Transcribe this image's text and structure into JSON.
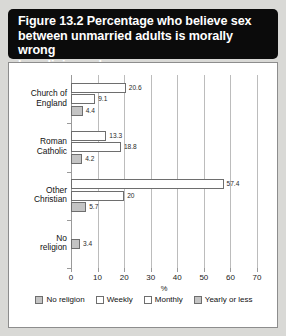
{
  "figure": {
    "title": "Figure 13.2 Percentage who believe sex\nbetween unmarried adults is morally wrong\nby religious observance"
  },
  "chart_data": {
    "type": "bar",
    "orientation": "horizontal",
    "title": "Figure 13.2 Percentage who believe sex between unmarried adults is morally wrong by religious observance",
    "xlabel": "%",
    "ylabel": "",
    "xlim": [
      0,
      70
    ],
    "xticks": [
      0,
      10,
      20,
      30,
      40,
      50,
      60,
      70
    ],
    "grid": true,
    "legend_position": "bottom",
    "categories": [
      "Church of\nEngland",
      "Roman\nCatholic",
      "Other\nChristian",
      "No\nreligion"
    ],
    "series": [
      {
        "name": "Weekly",
        "color": "#ffffff",
        "values": [
          20.6,
          13.3,
          57.4,
          null
        ]
      },
      {
        "name": "Monthly",
        "color": "#ffffff",
        "values": [
          9.1,
          18.8,
          20,
          null
        ]
      },
      {
        "name": "Yearly or less",
        "color": "#c4c4c4",
        "values": [
          4.4,
          4.2,
          5.7,
          null
        ]
      },
      {
        "name": "No religion",
        "color": "#c4c4c4",
        "values": [
          null,
          null,
          null,
          3.4
        ]
      }
    ],
    "legend": [
      {
        "label": "No religion",
        "swatch": "grey"
      },
      {
        "label": "Weekly",
        "swatch": "white"
      },
      {
        "label": "Monthly",
        "swatch": "white"
      },
      {
        "label": "Yearly or less",
        "swatch": "grey"
      }
    ],
    "bars": [
      {
        "category": "Church of England",
        "series": "Weekly",
        "value": 20.6,
        "label": "20.6",
        "swatch": "white"
      },
      {
        "category": "Church of England",
        "series": "Monthly",
        "value": 9.1,
        "label": "9.1",
        "swatch": "white"
      },
      {
        "category": "Church of England",
        "series": "Yearly or less",
        "value": 4.4,
        "label": "4.4",
        "swatch": "grey"
      },
      {
        "category": "Roman Catholic",
        "series": "Weekly",
        "value": 13.3,
        "label": "13.3",
        "swatch": "white"
      },
      {
        "category": "Roman Catholic",
        "series": "Monthly",
        "value": 18.8,
        "label": "18.8",
        "swatch": "white"
      },
      {
        "category": "Roman Catholic",
        "series": "Yearly or less",
        "value": 4.2,
        "label": "4.2",
        "swatch": "grey"
      },
      {
        "category": "Other Christian",
        "series": "Weekly",
        "value": 57.4,
        "label": "57.4",
        "swatch": "white"
      },
      {
        "category": "Other Christian",
        "series": "Monthly",
        "value": 20,
        "label": "20",
        "swatch": "white"
      },
      {
        "category": "Other Christian",
        "series": "Yearly or less",
        "value": 5.7,
        "label": "5.7",
        "swatch": "grey"
      },
      {
        "category": "No religion",
        "series": "No religion",
        "value": 3.4,
        "label": "3.4",
        "swatch": "grey"
      }
    ]
  },
  "axis": {
    "tick_labels": [
      "0",
      "10",
      "20",
      "30",
      "40",
      "50",
      "60",
      "70"
    ],
    "x_title": "%"
  },
  "categories": {
    "labels": [
      "Church of\nEngland",
      "Roman\nCatholic",
      "Other\nChristian",
      "No\nreligion"
    ]
  }
}
